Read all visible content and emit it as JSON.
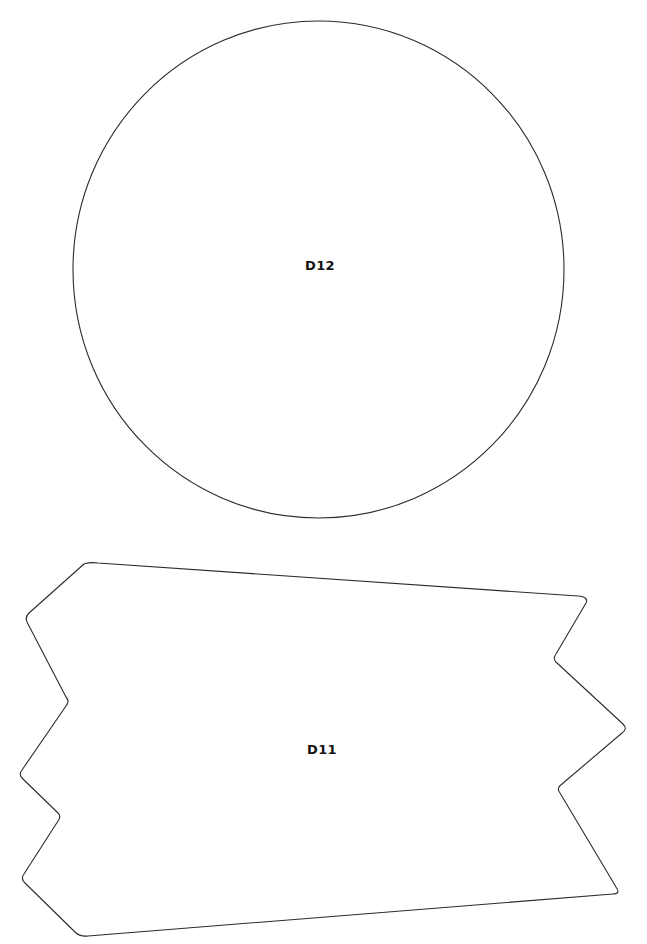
{
  "page": {
    "background_color": "#ffffff",
    "width": 647,
    "height": 944
  },
  "style": {
    "stroke_color": "#2b2b2b",
    "fill_color": "#ffffff",
    "label_color": "#131313",
    "stroke_width": 1.1
  },
  "parts": [
    {
      "id": "D12",
      "label": "D12",
      "shape_kind": "circle",
      "label_x": 320,
      "label_y": 266,
      "bounds": {
        "x": 73,
        "y": 21,
        "width": 491,
        "height": 497
      },
      "center": {
        "cx": 318.5,
        "cy": 269.5
      },
      "radii": {
        "rx": 245.5,
        "ry": 248.5
      },
      "path": "M 318.5 21 C 454.0 21 564.0 132.2 564.0 269.5 C 564.0 406.8 454.0 518.0 318.5 518.0 C 183.0 518.0 73.0 406.8 73.0 269.5 C 73.0 132.2 183.0 21 318.5 21 Z"
    },
    {
      "id": "D11",
      "label": "D11",
      "shape_kind": "zigzag-polygon",
      "label_x": 322,
      "label_y": 750,
      "bounds": {
        "x": 18,
        "y": 561,
        "width": 609,
        "height": 377
      },
      "vertices": [
        [
          92,
          563
        ],
        [
          585,
          597
        ],
        [
          554,
          656
        ],
        [
          625,
          727
        ],
        [
          560,
          787
        ],
        [
          618,
          893
        ],
        [
          80,
          936
        ],
        [
          22,
          880
        ],
        [
          57,
          822
        ],
        [
          20,
          775
        ],
        [
          67,
          705
        ],
        [
          25,
          620
        ]
      ],
      "path": "M 84 564 Q 90 562 98 563 L 578 596 Q 589 597 586 603 L 556 654 Q 552 659 557 663 L 623 724 Q 628 729 622 733 L 562 784 Q 556 788 560 793 L 616 887 Q 621 894 613 894 L 88 936 Q 80 937 75 932 L 26 884 Q 20 879 24 874 L 58 821 Q 62 816 57 812 L 23 779 Q 18 775 22 770 L 66 706 Q 70 701 66 697 L 28 624 Q 24 618 29 613 L 84 564 Z"
    }
  ]
}
